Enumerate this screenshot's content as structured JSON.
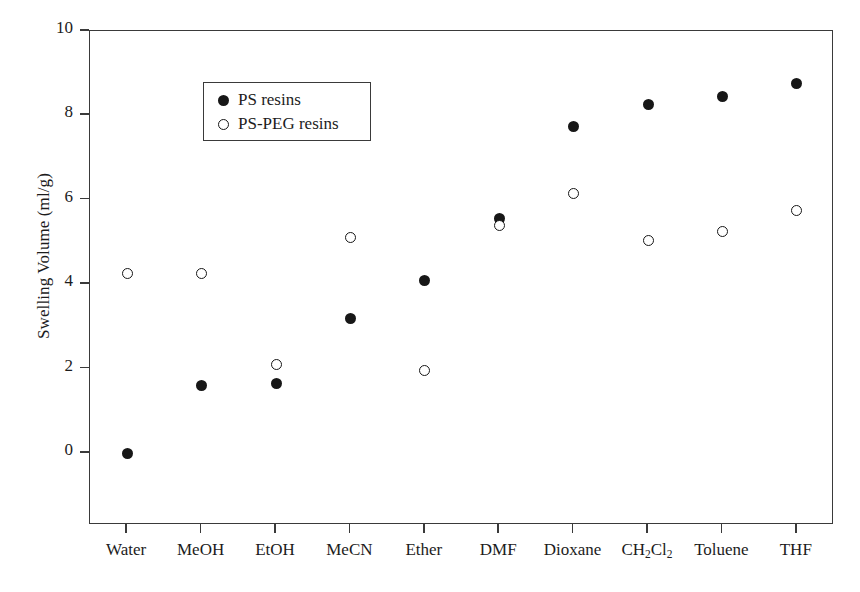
{
  "chart_data": {
    "type": "scatter",
    "title": "",
    "xlabel": "",
    "ylabel": "Swelling Volume (ml/g)",
    "categories": [
      "Water",
      "MeOH",
      "EtOH",
      "MeCN",
      "Ether",
      "DMF",
      "Dioxane",
      "CH2Cl2",
      "Toluene",
      "THF"
    ],
    "category_labels_html": [
      "Water",
      "MeOH",
      "EtOH",
      "MeCN",
      "Ether",
      "DMF",
      "Dioxane",
      "CH<sub>2</sub>Cl<sub>2</sub>",
      "Toluene",
      "THF"
    ],
    "ylim": [
      -1.7,
      10
    ],
    "yticks": [
      0,
      2,
      4,
      6,
      8,
      10
    ],
    "ytick_labels": [
      "0",
      "2",
      "4",
      "6",
      "8",
      "10"
    ],
    "grid": false,
    "legend_position": "top-left",
    "series": [
      {
        "name": "PS resins",
        "marker": "filled-circle",
        "color": "#171717",
        "values": [
          0.0,
          1.6,
          1.65,
          3.2,
          4.1,
          5.55,
          7.75,
          8.25,
          8.45,
          8.75
        ]
      },
      {
        "name": "PS-PEG resins",
        "marker": "open-circle",
        "color": "#171717",
        "values": [
          4.25,
          4.25,
          2.1,
          5.1,
          1.95,
          5.4,
          6.15,
          5.05,
          5.25,
          5.75
        ]
      }
    ]
  },
  "legend": {
    "entries": [
      {
        "label": "PS resins",
        "marker": "filled-circle"
      },
      {
        "label": "PS-PEG resins",
        "marker": "open-circle"
      }
    ]
  }
}
